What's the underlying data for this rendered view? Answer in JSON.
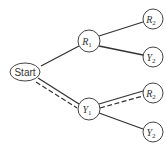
{
  "diagram": {
    "type": "probability-tree",
    "root": {
      "label": "Start"
    },
    "level1": [
      {
        "letter": "R",
        "sub": "1"
      },
      {
        "letter": "Y",
        "sub": "1"
      }
    ],
    "level2": [
      {
        "letter": "R",
        "sub": "2"
      },
      {
        "letter": "Y",
        "sub": "2"
      },
      {
        "letter": "R",
        "sub": "2"
      },
      {
        "letter": "Y",
        "sub": "2"
      }
    ],
    "highlighted_path": [
      "Start",
      "Y1",
      "R2"
    ],
    "colors": {
      "line": "#333333",
      "node_border": "#444444",
      "background": "#ffffff"
    }
  }
}
